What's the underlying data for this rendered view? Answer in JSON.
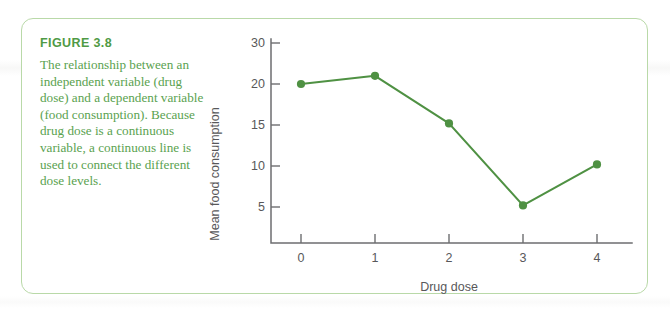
{
  "figure": {
    "label": "FIGURE 3.8",
    "caption": "The relationship between an independent variable (drug dose) and a dependent variable (food consumption). Because drug dose is a continuous variable, a continuous line is used to connect the different dose levels."
  },
  "colors": {
    "heading_green": "#4f9a45",
    "caption_green": "#5aa24f",
    "border_green": "#b9d9a8",
    "series_green": "#4f9143",
    "axis_gray": "#6d6e70",
    "text_gray": "#58585a"
  },
  "chart_data": {
    "type": "line",
    "title": "",
    "xlabel": "Drug dose",
    "ylabel": "Mean food consumption",
    "x": [
      0,
      1,
      2,
      3,
      4
    ],
    "xtick_labels": [
      "0",
      "1",
      "2",
      "3",
      "4"
    ],
    "ytick_labels": [
      "5",
      "10",
      "15",
      "20",
      "30"
    ],
    "ytick_values": [
      5,
      10,
      15,
      20,
      30
    ],
    "ylim": [
      0,
      33
    ],
    "xlim": [
      -0.55,
      4.55
    ],
    "grid": false,
    "legend": null,
    "series": [
      {
        "name": "Mean food consumption",
        "values": [
          20.0,
          22.0,
          15.2,
          5.2,
          10.2
        ],
        "color": "#4f9143",
        "marker": "circle"
      }
    ]
  }
}
